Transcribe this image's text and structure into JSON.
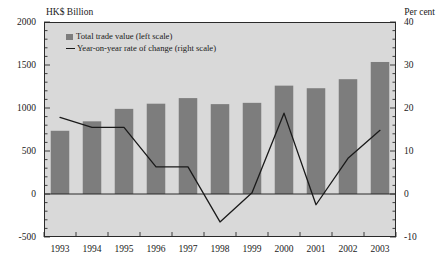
{
  "axis_titles": {
    "left_unit": "HK$ Billion",
    "right_unit": "Per cent"
  },
  "legend": {
    "bar_label": "Total trade value (left scale)",
    "line_label": "Year-on-year rate of change (right scale)"
  },
  "colors": {
    "bar_fill": "#7d7d7d",
    "line_stroke": "#1a1a1a",
    "plot_background": "#d9d9d9",
    "axis": "#2a2a2a",
    "text": "#1a1a1a",
    "page_background": "#ffffff"
  },
  "chart_data": {
    "type": "bar",
    "title": "",
    "xlabel": "",
    "categories": [
      "1993",
      "1994",
      "1995",
      "1996",
      "1997",
      "1998",
      "1999",
      "2000",
      "2001",
      "2002",
      "2003"
    ],
    "series": [
      {
        "name": "Total trade value (left scale)",
        "type": "bar",
        "axis": "left",
        "unit": "HK$ Billion",
        "values": [
          735,
          845,
          990,
          1050,
          1115,
          1045,
          1060,
          1260,
          1230,
          1335,
          1535
        ]
      },
      {
        "name": "Year-on-year rate of change (right scale)",
        "type": "line",
        "axis": "right",
        "unit": "Per cent",
        "values": [
          17.8,
          15.5,
          15.5,
          6.3,
          6.3,
          -6.5,
          0.3,
          18.8,
          -2.5,
          8.3,
          14.8
        ]
      }
    ],
    "left_axis": {
      "label": "HK$ Billion",
      "ylim": [
        -500,
        2000
      ],
      "ticks": [
        -500,
        0,
        500,
        1000,
        1500,
        2000
      ],
      "tick_labels": [
        "-500",
        "0",
        "500",
        "1000",
        "1500",
        "2000"
      ],
      "minor_tick_step": 100
    },
    "right_axis": {
      "label": "Per cent",
      "ylim": [
        -10,
        40
      ],
      "ticks": [
        -10,
        0,
        10,
        20,
        30,
        40
      ],
      "tick_labels": [
        "-10",
        "0",
        "10",
        "20",
        "30",
        "40"
      ],
      "minor_tick_step": 2
    },
    "grid": false,
    "legend_position": "upper-left-inside",
    "zero_line": true
  }
}
